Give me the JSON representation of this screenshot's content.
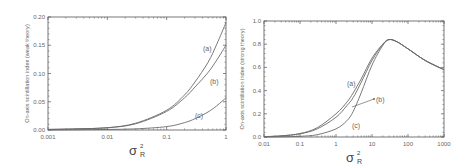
{
  "colors": {
    "axis": "#555555",
    "curve": "#6a6a6a",
    "text": "#666666",
    "background": "#ffffff"
  },
  "chart_data": [
    {
      "type": "line",
      "title": "",
      "xlabel": "σ²_R",
      "ylabel": "On-axis scintillation index (weak theory)",
      "xscale": "log",
      "xlim": [
        0.001,
        1
      ],
      "ylim": [
        0,
        0.2
      ],
      "x_ticks": [
        "0.001",
        "0.01",
        "0.1",
        "1"
      ],
      "y_ticks": [
        "0.00",
        "0.05",
        "0.10",
        "0.15",
        "0.20"
      ],
      "grid": false,
      "legend": "inline labels",
      "x": [
        0.001,
        0.003,
        0.01,
        0.03,
        0.1,
        0.2,
        0.3,
        0.5,
        0.7,
        1.0
      ],
      "series": [
        {
          "name": "(a)",
          "values": [
            0.001,
            0.002,
            0.004,
            0.012,
            0.035,
            0.062,
            0.085,
            0.12,
            0.152,
            0.19
          ]
        },
        {
          "name": "(b)",
          "values": [
            0.001,
            0.002,
            0.004,
            0.011,
            0.033,
            0.057,
            0.076,
            0.102,
            0.124,
            0.15
          ]
        },
        {
          "name": "(c)",
          "values": [
            0.0,
            0.0005,
            0.001,
            0.002,
            0.006,
            0.013,
            0.02,
            0.032,
            0.043,
            0.057
          ]
        }
      ]
    },
    {
      "type": "line",
      "title": "",
      "xlabel": "σ²_R",
      "ylabel": "On-axis scintillation index (strong theory)",
      "xscale": "log",
      "xlim": [
        0.01,
        1000
      ],
      "ylim": [
        0,
        1.0
      ],
      "x_ticks": [
        "0.01",
        "0.1",
        "1",
        "10",
        "100",
        "1000"
      ],
      "y_ticks": [
        "0.0",
        "0.2",
        "0.4",
        "0.6",
        "0.8",
        "1.0"
      ],
      "grid": false,
      "legend": "inline labels",
      "x": [
        0.01,
        0.03,
        0.1,
        0.3,
        1,
        2,
        3,
        5,
        10,
        20,
        30,
        50,
        100,
        300,
        1000
      ],
      "series": [
        {
          "name": "(a)",
          "values": [
            0.003,
            0.01,
            0.03,
            0.08,
            0.2,
            0.3,
            0.38,
            0.5,
            0.68,
            0.8,
            0.84,
            0.82,
            0.76,
            0.66,
            0.58
          ]
        },
        {
          "name": "(b)",
          "values": [
            0.003,
            0.009,
            0.027,
            0.07,
            0.17,
            0.27,
            0.34,
            0.47,
            0.66,
            0.8,
            0.84,
            0.82,
            0.76,
            0.66,
            0.58
          ]
        },
        {
          "name": "(c)",
          "values": [
            0.0,
            0.002,
            0.006,
            0.02,
            0.07,
            0.14,
            0.22,
            0.38,
            0.62,
            0.79,
            0.84,
            0.82,
            0.76,
            0.66,
            0.58
          ]
        }
      ]
    }
  ],
  "left": {
    "ylabel": "On-axis scintillation index (weak theory)",
    "xlabel_main": "σ",
    "xlabel_sup": "2",
    "xlabel_sub": "R",
    "labels": [
      "(a)",
      "(b)",
      "(c)"
    ]
  },
  "right": {
    "ylabel": "On-axis scintillation index (strong theory)",
    "xlabel_main": "σ",
    "xlabel_sup": "2",
    "xlabel_sub": "R",
    "labels": [
      "(a)",
      "(b)",
      "(c)"
    ]
  }
}
